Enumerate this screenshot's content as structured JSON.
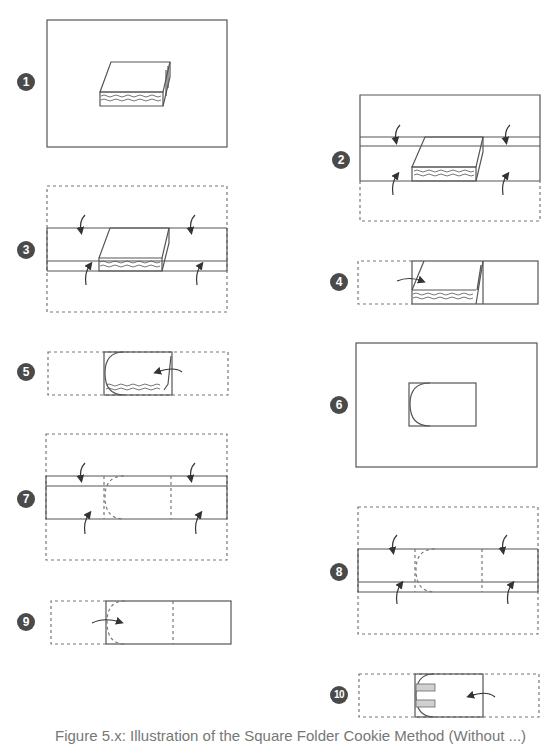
{
  "diagram": {
    "type": "folding-instructions",
    "steps": [
      {
        "number": "1",
        "description": "Flat paper with layered cookie/sandwich block centered"
      },
      {
        "number": "2",
        "description": "Fold top and bottom flaps toward center (top flap folds down, bottom folds up)"
      },
      {
        "number": "3",
        "description": "Fold both long edges inward over the block"
      },
      {
        "number": "4",
        "description": "Fold left side over onto the block"
      },
      {
        "number": "5",
        "description": "Fold right side over, rounding the corner"
      },
      {
        "number": "6",
        "description": "Result: rounded packet centered on fresh sheet"
      },
      {
        "number": "7",
        "description": "Fold top and bottom edges inward around packet outline"
      },
      {
        "number": "8",
        "description": "Fold both long edges inward again"
      },
      {
        "number": "9",
        "description": "Fold left flap over to the right"
      },
      {
        "number": "10",
        "description": "Fold right flap over to the left and tuck in; tabs shown shaded"
      }
    ],
    "line_colors": {
      "solid": "#555555",
      "dashed": "#777777",
      "badge": "#4a4a4a",
      "tab_fill": "#d0d0d0"
    }
  },
  "caption": "Figure 5.x: Illustration of the Square Folder Cookie Method (Without ...)"
}
